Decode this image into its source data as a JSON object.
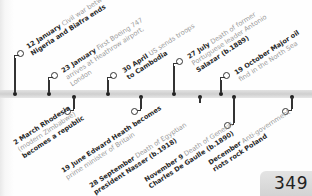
{
  "timeline": {
    "above": [
      {
        "date": "12 January",
        "lines": [
          "Civil war between",
          "Nigeria and Biafra ends"
        ]
      },
      {
        "date": "23 January",
        "lines": [
          "First Boeing 747",
          "arrives at Heathrow airport,",
          "London"
        ]
      },
      {
        "date": "30 April",
        "lines": [
          "US sends troops",
          "to Cambodia"
        ]
      },
      {
        "date": "27 July",
        "lines": [
          "Death of former",
          "Portuguese leader Antonio",
          "Salazar (b.1889)"
        ]
      },
      {
        "date": "19 October",
        "lines": [
          "Major oil",
          "find in the North Sea"
        ]
      }
    ],
    "below": [
      {
        "date": "2 March",
        "lines": [
          "Rhodesia",
          "(modern Zimbabwe)",
          "becomes a republic"
        ]
      },
      {
        "date": "19 June",
        "lines": [
          "Edward Heath becomes",
          "prime minister of Britain"
        ]
      },
      {
        "date": "28 September",
        "lines": [
          "Death of Egyptian",
          "president Nasser (b.1918)"
        ]
      },
      {
        "date": "November 9",
        "lines": [
          "Death of General",
          "Charles De Gaulle (b.1890)"
        ]
      },
      {
        "date": "December",
        "lines": [
          "Anti-government",
          "riots rock Poland"
        ]
      }
    ]
  },
  "page": {
    "number": "349"
  }
}
